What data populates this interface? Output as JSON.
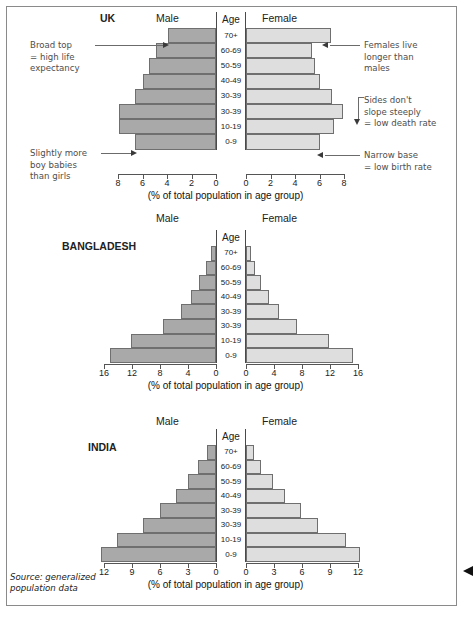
{
  "source_note": "Source: generalized\npopulation data",
  "axis_title": "(% of total population in age group)",
  "labels": {
    "male": "Male",
    "female": "Female",
    "age": "Age"
  },
  "colors": {
    "male_bar": "#a9a9a9",
    "female_bar": "#dedede",
    "bar_outline": "#6f6f6f",
    "axis": "#555555",
    "frame": "#8a8a8a",
    "annotation_text": "#4e4e4e"
  },
  "age_groups": [
    "70+",
    "60-69",
    "50-59",
    "40-49",
    "30-39",
    "30-39",
    "10-19",
    "0-9"
  ],
  "annotations": [
    {
      "id": "broad-top",
      "text": "Broad top\n= high life\n   expectancy"
    },
    {
      "id": "slightly-more-boys",
      "text": "Slightly more\nboy babies\nthan girls"
    },
    {
      "id": "females-live-longer",
      "text": "Females live\nlonger than\nmales"
    },
    {
      "id": "sides-dont-slope",
      "text": "Sides don't\nslope steeply\n= low death rate"
    },
    {
      "id": "narrow-base",
      "text": "Narrow base\n= low birth rate"
    }
  ],
  "chart_data": [
    {
      "type": "bar",
      "subtype": "population-pyramid",
      "title": "UK",
      "xlabel": "(% of total population in age group)",
      "ylabel": "Age",
      "xlim": [
        0,
        8
      ],
      "xticks": [
        0,
        2,
        4,
        6,
        8
      ],
      "grid": false,
      "categories": [
        "70+",
        "60-69",
        "50-59",
        "40-49",
        "30-39",
        "30-39",
        "10-19",
        "0-9"
      ],
      "series": [
        {
          "name": "Male",
          "values": [
            3.9,
            4.9,
            5.5,
            6.0,
            6.6,
            7.9,
            7.9,
            6.6
          ]
        },
        {
          "name": "Female",
          "values": [
            6.9,
            5.4,
            5.6,
            6.0,
            7.0,
            7.9,
            7.2,
            6.0
          ]
        }
      ]
    },
    {
      "type": "bar",
      "subtype": "population-pyramid",
      "title": "BANGLADESH",
      "xlabel": "(% of total population in age group)",
      "ylabel": "Age",
      "xlim": [
        0,
        16
      ],
      "xticks": [
        0,
        4,
        8,
        12,
        16
      ],
      "grid": false,
      "categories": [
        "70+",
        "60-69",
        "50-59",
        "40-49",
        "30-39",
        "30-39",
        "10-19",
        "0-9"
      ],
      "series": [
        {
          "name": "Male",
          "values": [
            0.7,
            1.5,
            2.5,
            3.6,
            5.0,
            7.6,
            12.1,
            15.2
          ]
        },
        {
          "name": "Female",
          "values": [
            0.7,
            1.3,
            2.2,
            3.3,
            4.7,
            7.3,
            11.8,
            15.3
          ]
        }
      ]
    },
    {
      "type": "bar",
      "subtype": "population-pyramid",
      "title": "INDIA",
      "xlabel": "(% of total population in age group)",
      "ylabel": "Age",
      "xlim": [
        0,
        12
      ],
      "xticks": [
        0,
        3,
        6,
        9,
        12
      ],
      "grid": false,
      "categories": [
        "70+",
        "60-69",
        "50-59",
        "40-49",
        "30-39",
        "30-39",
        "10-19",
        "0-9"
      ],
      "series": [
        {
          "name": "Male",
          "values": [
            1.0,
            1.9,
            3.0,
            4.3,
            6.0,
            7.8,
            10.6,
            12.3
          ]
        },
        {
          "name": "Female",
          "values": [
            0.9,
            1.6,
            2.9,
            4.2,
            5.9,
            7.7,
            10.7,
            12.2
          ]
        }
      ]
    }
  ]
}
